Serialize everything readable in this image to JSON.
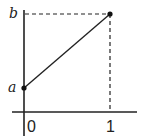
{
  "diagram": {
    "type": "line-segment-graph",
    "labels": {
      "y_upper": "b",
      "y_lower": "a",
      "x_zero": "0",
      "x_one": "1"
    },
    "points": [
      {
        "name": "start",
        "x": 0,
        "y": "a"
      },
      {
        "name": "end",
        "x": 1,
        "y": "b"
      }
    ],
    "colors": {
      "line": "#222222",
      "background": "#ffffff"
    }
  }
}
